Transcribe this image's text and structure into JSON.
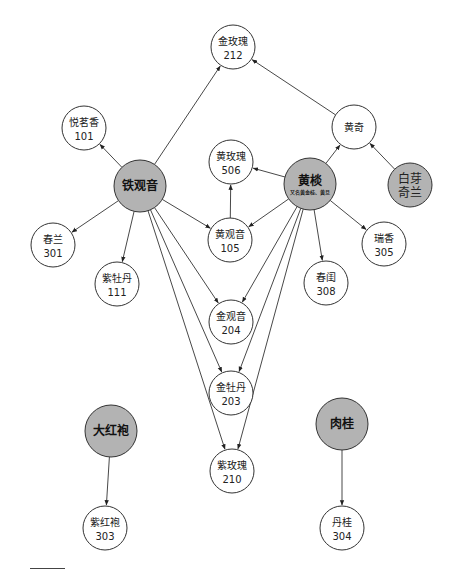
{
  "colors": {
    "parent_fill": "#b3b3b3",
    "child_fill": "#ffffff",
    "stroke": "#333333",
    "edge": "#333333"
  },
  "nodes": [
    {
      "id": "jinmeigui",
      "name": "金玫瑰",
      "code": "212",
      "x": 233,
      "y": 47,
      "r": 22,
      "type": "child"
    },
    {
      "id": "yuemingxiang",
      "name": "悦茗香",
      "code": "101",
      "x": 84,
      "y": 128,
      "r": 22,
      "type": "child"
    },
    {
      "id": "huangqi",
      "name": "黄奇",
      "code": "",
      "x": 354,
      "y": 127,
      "r": 22,
      "type": "child"
    },
    {
      "id": "huangmeigui",
      "name": "黄玫瑰",
      "code": "506",
      "x": 231,
      "y": 162,
      "r": 22,
      "type": "child"
    },
    {
      "id": "tieguanyin",
      "name": "铁观音",
      "code": "",
      "x": 140,
      "y": 186,
      "r": 26,
      "type": "parent"
    },
    {
      "id": "huangdan",
      "name": "黄棪",
      "code": "",
      "subtitle": "又名黄金桂、黄旦",
      "x": 310,
      "y": 184,
      "r": 26,
      "type": "parent"
    },
    {
      "id": "baiyaqilan",
      "name": "白芽",
      "name2": "奇兰",
      "code": "",
      "x": 410,
      "y": 185,
      "r": 22,
      "type": "parent"
    },
    {
      "id": "huangguanyin",
      "name": "黄观音",
      "code": "105",
      "x": 230,
      "y": 240,
      "r": 22,
      "type": "child"
    },
    {
      "id": "chunlan",
      "name": "春兰",
      "code": "301",
      "x": 53,
      "y": 245,
      "r": 22,
      "type": "child"
    },
    {
      "id": "ruixiang",
      "name": "瑞香",
      "code": "305",
      "x": 384,
      "y": 244,
      "r": 22,
      "type": "child"
    },
    {
      "id": "zimudan",
      "name": "紫牡丹",
      "code": "111",
      "x": 117,
      "y": 284,
      "r": 22,
      "type": "child"
    },
    {
      "id": "chungui",
      "name": "春闺",
      "code": "308",
      "x": 326,
      "y": 283,
      "r": 22,
      "type": "child"
    },
    {
      "id": "jinguanyin",
      "name": "金观音",
      "code": "204",
      "x": 231,
      "y": 322,
      "r": 22,
      "type": "child"
    },
    {
      "id": "jinmudan",
      "name": "金牡丹",
      "code": "203",
      "x": 231,
      "y": 393,
      "r": 22,
      "type": "child"
    },
    {
      "id": "dahongpao",
      "name": "大红袍",
      "code": "",
      "x": 111,
      "y": 431,
      "r": 26,
      "type": "parent"
    },
    {
      "id": "rougui",
      "name": "肉桂",
      "code": "",
      "x": 342,
      "y": 424,
      "r": 26,
      "type": "parent"
    },
    {
      "id": "zimeigui",
      "name": "紫玫瑰",
      "code": "210",
      "x": 232,
      "y": 471,
      "r": 22,
      "type": "child"
    },
    {
      "id": "zihongpao",
      "name": "紫红袍",
      "code": "303",
      "x": 105,
      "y": 528,
      "r": 22,
      "type": "child"
    },
    {
      "id": "dangui",
      "name": "丹桂",
      "code": "304",
      "x": 342,
      "y": 528,
      "r": 22,
      "type": "child"
    }
  ],
  "edges": [
    {
      "from": "tieguanyin",
      "to": "jinmeigui"
    },
    {
      "from": "tieguanyin",
      "to": "yuemingxiang"
    },
    {
      "from": "tieguanyin",
      "to": "chunlan"
    },
    {
      "from": "tieguanyin",
      "to": "zimudan"
    },
    {
      "from": "tieguanyin",
      "to": "huangguanyin"
    },
    {
      "from": "tieguanyin",
      "to": "jinguanyin"
    },
    {
      "from": "tieguanyin",
      "to": "jinmudan"
    },
    {
      "from": "tieguanyin",
      "to": "zimeigui"
    },
    {
      "from": "huangdan",
      "to": "huangqi"
    },
    {
      "from": "huangdan",
      "to": "huangmeigui"
    },
    {
      "from": "huangdan",
      "to": "huangguanyin"
    },
    {
      "from": "huangdan",
      "to": "chungui"
    },
    {
      "from": "huangdan",
      "to": "ruixiang"
    },
    {
      "from": "huangdan",
      "to": "jinguanyin"
    },
    {
      "from": "huangdan",
      "to": "jinmudan"
    },
    {
      "from": "huangdan",
      "to": "zimeigui"
    },
    {
      "from": "huangqi",
      "to": "jinmeigui"
    },
    {
      "from": "baiyaqilan",
      "to": "huangqi"
    },
    {
      "from": "huangguanyin",
      "to": "huangmeigui"
    },
    {
      "from": "dahongpao",
      "to": "zihongpao"
    },
    {
      "from": "rougui",
      "to": "dangui"
    }
  ]
}
